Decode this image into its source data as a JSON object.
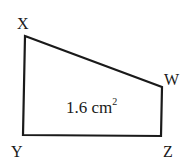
{
  "diagram": {
    "shape": "quadrilateral",
    "vertices": [
      {
        "name": "X",
        "x": 25,
        "y": 36
      },
      {
        "name": "W",
        "x": 162,
        "y": 87
      },
      {
        "name": "Z",
        "x": 161,
        "y": 136
      },
      {
        "name": "Y",
        "x": 23,
        "y": 135
      }
    ],
    "labels": {
      "x": "X",
      "w": "W",
      "y": "Y",
      "z": "Z"
    },
    "area_value": "1.6 cm",
    "area_exponent": "2",
    "stroke_color": "#1a1a1a"
  }
}
